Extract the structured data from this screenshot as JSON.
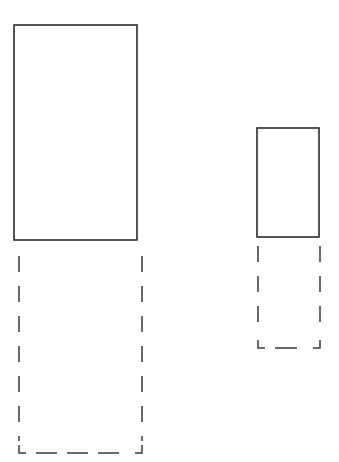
{
  "diagram": {
    "type": "rectangle-pair-comparison",
    "stroke_color": "#2b2b2b",
    "background": "#ffffff",
    "shapes": [
      {
        "id": "large",
        "solid_rect": {
          "x": 14,
          "y": 25,
          "width": 123,
          "height": 215
        },
        "dashed_rect": {
          "x": 19,
          "y": 256,
          "width": 123,
          "height": 197,
          "open_top": true
        }
      },
      {
        "id": "small",
        "solid_rect": {
          "x": 257,
          "y": 128,
          "width": 62,
          "height": 109
        },
        "dashed_rect": {
          "x": 258,
          "y": 246,
          "width": 62,
          "height": 102,
          "open_top": true
        }
      }
    ]
  }
}
